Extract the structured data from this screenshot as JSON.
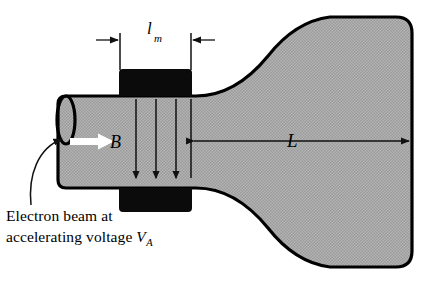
{
  "figure": {
    "colors": {
      "tube_fill_gray": "#a8a8a8",
      "outline_black": "#000000",
      "pole_piece_black": "#0b0b0b",
      "beam_arrow_white": "#ffffff",
      "background": "#ffffff"
    },
    "labels": {
      "magnet_length_symbol": "l",
      "magnet_length_subscript": "m",
      "field_symbol": "B",
      "drift_length_symbol": "L"
    },
    "caption": {
      "line1": "Electron beam at",
      "line2_prefix": "accelerating voltage ",
      "line2_symbol": "V",
      "line2_subscript": "A"
    },
    "elements": {
      "tube_neck": "electron-gun-neck",
      "flare": "tube-flare",
      "screen": "phosphor-screen",
      "magnet_top": "top-pole-piece",
      "magnet_bottom": "bottom-pole-piece",
      "field_arrows_count": 3,
      "beam_arrow": "electron-beam-direction",
      "leader": "caption-leader-line"
    }
  }
}
